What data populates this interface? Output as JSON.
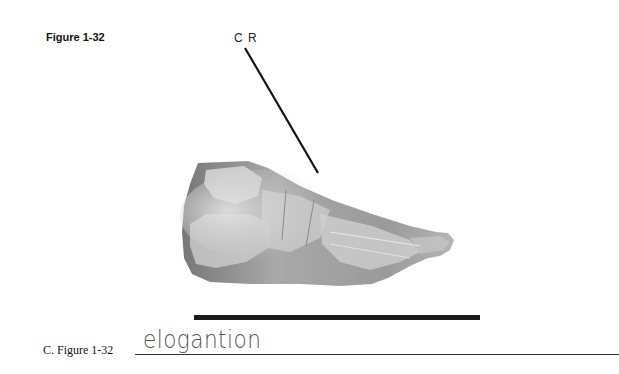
{
  "figure": {
    "label": "Figure 1-32",
    "central_ray_label": "C R",
    "image_subject": "lateral foot radiograph",
    "colors": {
      "line": "#111111",
      "foot_dark": "#6e6e6e",
      "foot_light": "#d8d8d8",
      "bar": "#1a1a1a"
    }
  },
  "question": {
    "label": "C.  Figure 1-32",
    "answer": "elogantion"
  }
}
